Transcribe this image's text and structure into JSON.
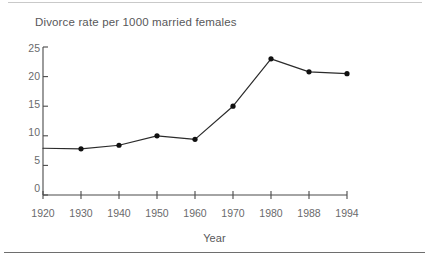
{
  "chart_data": {
    "type": "line",
    "title": "Divorce rate per 1000 married females",
    "xlabel": "Year",
    "ylabel": "",
    "categories": [
      "1920",
      "1930",
      "1940",
      "1950",
      "1960",
      "1970",
      "1980",
      "1988",
      "1994"
    ],
    "x": [
      1920,
      1930,
      1940,
      1950,
      1960,
      1970,
      1980,
      1988,
      1994
    ],
    "values": [
      7.9,
      7.8,
      8.4,
      10.0,
      9.4,
      15.0,
      23.0,
      20.8,
      20.5
    ],
    "series": [
      {
        "name": "Divorce rate per 1000 married females",
        "values": [
          7.9,
          7.8,
          8.4,
          10.0,
          9.4,
          15.0,
          23.0,
          20.8,
          20.5
        ]
      }
    ],
    "ylim": [
      0,
      25
    ],
    "ytick_labels": [
      "0",
      "5",
      "10",
      "15",
      "20",
      "25"
    ],
    "ytick_values": [
      0,
      5,
      10,
      15,
      20,
      25
    ],
    "xtick_labels": [
      "1920",
      "1930",
      "1940",
      "1950",
      "1960",
      "1970",
      "1980",
      "1988",
      "1994"
    ],
    "grid": false,
    "legend": null,
    "legend_position": "none",
    "marker": "filled-circle",
    "markers_shown_from_index": 1,
    "line_color": "#2b2b2b",
    "marker_color": "#111111",
    "axis_color": "#4a4a4a",
    "text_color": "#58585a",
    "background_color": "#ffffff"
  }
}
